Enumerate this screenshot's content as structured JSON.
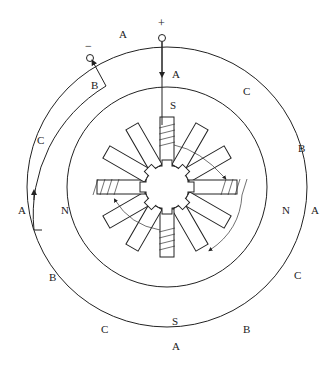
{
  "diagram": {
    "type": "stepper-motor-cross-section",
    "terminals": {
      "positive": {
        "symbol": "+"
      },
      "negative": {
        "symbol": "−"
      }
    },
    "outer_labels": {
      "top": "A",
      "top_right": "C",
      "right_upper": "B",
      "right": "A",
      "right_lower": "C",
      "bottom_right": "B",
      "bottom": "A",
      "bottom_left": "C",
      "left_lower": "B",
      "left": "A",
      "left_upper": "C",
      "top_left": "B",
      "outside_top": "A"
    },
    "pole_labels": {
      "top": "S",
      "bottom": "S",
      "left": "N",
      "right": "N"
    },
    "stator_poles": 12,
    "rotor_teeth": 8,
    "colors": {
      "line": "#222222",
      "background": "#ffffff"
    }
  }
}
